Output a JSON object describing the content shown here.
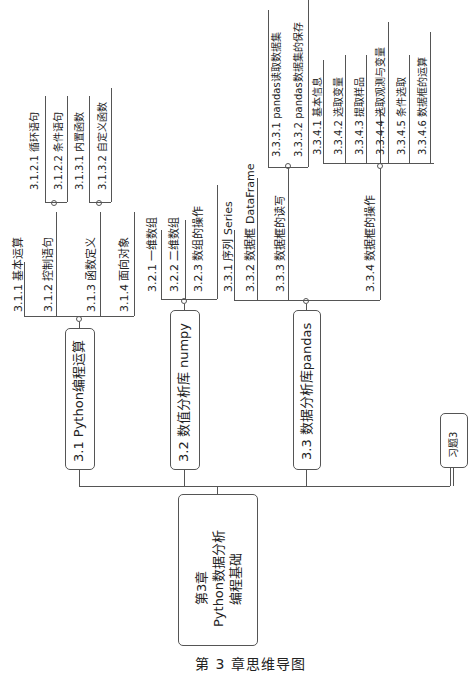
{
  "root": {
    "lines": [
      "第3章",
      "Python数据分析",
      "编程基础"
    ]
  },
  "branches": [
    {
      "label": "3.1  Python编程运算",
      "children": [
        {
          "label": "3.1.1  基本运算"
        },
        {
          "label": "3.1.2  控制语句",
          "children": [
            "3.1.2.1  循环语句",
            "3.1.2.2  条件语句"
          ]
        },
        {
          "label": "3.1.3  函数定义",
          "children": [
            "3.1.3.1 内置函数",
            "3.1.3.2 自定义函数"
          ]
        },
        {
          "label": "3.1.4  面向对象"
        }
      ]
    },
    {
      "label": "3.2  数值分析库 numpy",
      "children": [
        {
          "label": "3.2.1  一维数组"
        },
        {
          "label": "3.2.2  二维数组"
        },
        {
          "label": "3.2.3  数组的操作"
        }
      ]
    },
    {
      "label": "3.3  数据分析库pandas",
      "children": [
        {
          "label": "3.3.1  序列 Series"
        },
        {
          "label": "3.3.2  数据框 DataFrame"
        },
        {
          "label": "3.3.3  数据框的读写",
          "children": [
            "3.3.3.1  pandas读取数据集",
            "3.3.3.2  pandas数据集的保存"
          ]
        },
        {
          "label": "3.3.4  数据框的操作",
          "children": [
            "3.3.4.1  基本信息",
            "3.3.4.2  选取变量",
            "3.3.4.3  提取样品",
            "3.3.4.4  选取观测与变量",
            "3.3.4.5  条件选取",
            "3.3.4.6  数据框的运算"
          ]
        }
      ]
    },
    {
      "label": "习题3"
    }
  ],
  "caption": "第 3 章思维导图"
}
